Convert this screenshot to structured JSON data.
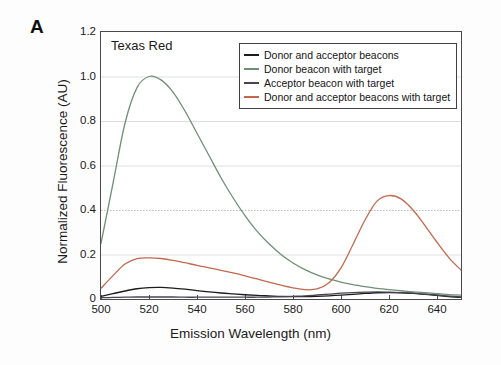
{
  "figure": {
    "panel_letter": "A",
    "background_color": "#fdfdfd",
    "plot_background": "#ffffff",
    "frame_color": "#4a4a4a"
  },
  "chart_data": {
    "type": "line",
    "title": "",
    "annotation": "Texas Red",
    "xlabel": "Emission Wavelength (nm)",
    "ylabel": "Normalized Fluorescence (AU)",
    "xlim": [
      500,
      650
    ],
    "ylim": [
      0,
      1.2
    ],
    "xticks": [
      500,
      520,
      540,
      560,
      580,
      600,
      620,
      640
    ],
    "xtick_labels": [
      "500",
      "520",
      "540",
      "560",
      "580",
      "600",
      "620",
      "640"
    ],
    "yticks": [
      0,
      0.2,
      0.4,
      0.6,
      0.8,
      1.0,
      1.2
    ],
    "ytick_labels": [
      "0",
      "0.2",
      "0.4",
      "0.6",
      "0.8",
      "1.0",
      "1.2"
    ],
    "grid": "horizontal-light",
    "legend_position": "top-right-inside",
    "series": [
      {
        "name": "Donor and acceptor beacons",
        "color": "#1c1c1c",
        "x": [
          500,
          505,
          510,
          515,
          520,
          525,
          530,
          535,
          540,
          545,
          550,
          555,
          560,
          565,
          570,
          575,
          580,
          585,
          590,
          595,
          600,
          605,
          610,
          615,
          620,
          625,
          630,
          635,
          640,
          645,
          650
        ],
        "values": [
          0.012,
          0.024,
          0.036,
          0.046,
          0.051,
          0.052,
          0.049,
          0.044,
          0.038,
          0.032,
          0.027,
          0.023,
          0.019,
          0.016,
          0.014,
          0.012,
          0.011,
          0.011,
          0.012,
          0.014,
          0.017,
          0.021,
          0.025,
          0.028,
          0.029,
          0.028,
          0.025,
          0.021,
          0.016,
          0.011,
          0.007
        ]
      },
      {
        "name": "Donor beacon with target",
        "color": "#6f8f76",
        "x": [
          500,
          505,
          510,
          515,
          520,
          525,
          530,
          535,
          540,
          545,
          550,
          555,
          560,
          565,
          570,
          575,
          580,
          585,
          590,
          595,
          600,
          605,
          610,
          615,
          620,
          625,
          630,
          635,
          640,
          645,
          650
        ],
        "values": [
          0.25,
          0.52,
          0.79,
          0.95,
          1.0,
          0.985,
          0.93,
          0.845,
          0.745,
          0.645,
          0.545,
          0.455,
          0.375,
          0.305,
          0.248,
          0.2,
          0.162,
          0.132,
          0.108,
          0.09,
          0.076,
          0.065,
          0.056,
          0.048,
          0.042,
          0.037,
          0.032,
          0.028,
          0.024,
          0.02,
          0.017
        ]
      },
      {
        "name": "Acceptor beacon with target",
        "color": "#4a4452",
        "x": [
          500,
          505,
          510,
          515,
          520,
          525,
          530,
          535,
          540,
          545,
          550,
          555,
          560,
          565,
          570,
          575,
          580,
          585,
          590,
          595,
          600,
          605,
          610,
          615,
          620,
          625,
          630,
          635,
          640,
          645,
          650
        ],
        "values": [
          0.006,
          0.007,
          0.008,
          0.009,
          0.009,
          0.009,
          0.009,
          0.008,
          0.008,
          0.008,
          0.008,
          0.008,
          0.008,
          0.008,
          0.009,
          0.01,
          0.012,
          0.014,
          0.018,
          0.022,
          0.026,
          0.029,
          0.031,
          0.032,
          0.031,
          0.029,
          0.026,
          0.022,
          0.018,
          0.013,
          0.009
        ]
      },
      {
        "name": "Donor and acceptor beacons with target",
        "color": "#c1694f",
        "x": [
          500,
          505,
          510,
          515,
          520,
          525,
          530,
          535,
          540,
          545,
          550,
          555,
          560,
          565,
          570,
          575,
          580,
          585,
          590,
          595,
          600,
          605,
          610,
          615,
          620,
          625,
          630,
          635,
          640,
          645,
          650
        ],
        "values": [
          0.048,
          0.105,
          0.157,
          0.181,
          0.185,
          0.182,
          0.174,
          0.163,
          0.151,
          0.14,
          0.129,
          0.117,
          0.104,
          0.09,
          0.076,
          0.062,
          0.05,
          0.042,
          0.045,
          0.073,
          0.14,
          0.245,
          0.355,
          0.44,
          0.465,
          0.45,
          0.4,
          0.33,
          0.255,
          0.185,
          0.13
        ]
      }
    ]
  },
  "legend": {
    "entries": [
      {
        "label": "Donor and acceptor beacons",
        "color": "#1c1c1c"
      },
      {
        "label": "Donor beacon with target",
        "color": "#6f8f76"
      },
      {
        "label": "Acceptor beacon with target",
        "color": "#4a4452"
      },
      {
        "label": "Donor and acceptor beacons with target",
        "color": "#c1694f"
      }
    ]
  }
}
